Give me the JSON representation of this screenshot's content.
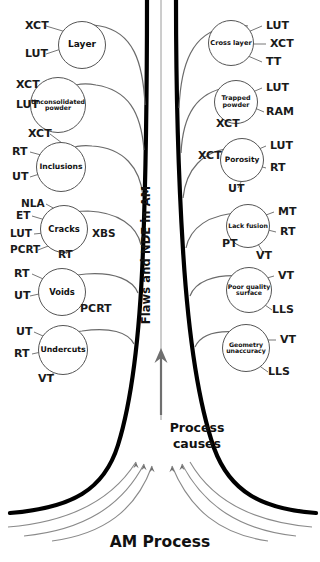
{
  "diagram": {
    "title_vertical": "Flaws and NDE in AM",
    "trunk_mid_label": "Process\ncauses",
    "trunk_mid_line1": "Process",
    "trunk_mid_line2": "causes",
    "base_label": "AM Process",
    "colors": {
      "trunk": "#000000",
      "branch": "#6b6b6b",
      "node_stroke": "#555555",
      "text": "#1a1a1a",
      "background": "#ffffff"
    }
  },
  "left_branches": [
    {
      "id": "layer",
      "label": "Layer",
      "label_lines": [
        "Layer"
      ],
      "nde": [
        "XCT",
        "LUT"
      ]
    },
    {
      "id": "unconsolidated-powder",
      "label": "Unconsolidated powder",
      "label_lines": [
        "Unconsolidated",
        "powder"
      ],
      "nde": [
        "XCT",
        "LUT"
      ]
    },
    {
      "id": "inclusions",
      "label": "Inclusions",
      "label_lines": [
        "Inclusions"
      ],
      "nde": [
        "XCT",
        "RT",
        "UT"
      ]
    },
    {
      "id": "cracks",
      "label": "Cracks",
      "label_lines": [
        "Cracks"
      ],
      "nde": [
        "NLA",
        "ET",
        "LUT",
        "PCRT",
        "RT",
        "XBS"
      ]
    },
    {
      "id": "voids",
      "label": "Voids",
      "label_lines": [
        "Voids"
      ],
      "nde": [
        "RT",
        "UT",
        "PCRT"
      ]
    },
    {
      "id": "undercuts",
      "label": "Undercuts",
      "label_lines": [
        "Undercuts"
      ],
      "nde": [
        "UT",
        "RT",
        "VT"
      ]
    }
  ],
  "right_branches": [
    {
      "id": "cross-layer",
      "label": "Cross layer",
      "label_lines": [
        "Cross layer"
      ],
      "nde": [
        "LUT",
        "XCT",
        "TT"
      ]
    },
    {
      "id": "trapped-powder",
      "label": "Trapped powder",
      "label_lines": [
        "Trapped",
        "powder"
      ],
      "nde": [
        "LUT",
        "RAM",
        "XCT"
      ]
    },
    {
      "id": "porosity",
      "label": "Porosity",
      "label_lines": [
        "Porosity"
      ],
      "nde": [
        "LUT",
        "RT",
        "XCT",
        "UT"
      ]
    },
    {
      "id": "lack-fusion",
      "label": "Lack fusion",
      "label_lines": [
        "Lack fusion"
      ],
      "nde": [
        "MT",
        "RT",
        "PT",
        "VT"
      ]
    },
    {
      "id": "poor-quality-surface",
      "label": "Poor quality surface",
      "label_lines": [
        "Poor quality",
        "surface"
      ],
      "nde": [
        "VT",
        "LLS"
      ]
    },
    {
      "id": "geometry-unaccuracy",
      "label": "Geometry unaccuracy",
      "label_lines": [
        "Geometry",
        "unaccuracy"
      ],
      "nde": [
        "VT",
        "LLS"
      ]
    }
  ],
  "nde_labels": {
    "l_layer_0": "XCT",
    "l_layer_1": "LUT",
    "l_unc_0": "XCT",
    "l_unc_1": "LUT",
    "l_inc_0": "XCT",
    "l_inc_1": "RT",
    "l_inc_2": "UT",
    "l_crk_0": "NLA",
    "l_crk_1": "ET",
    "l_crk_2": "LUT",
    "l_crk_3": "PCRT",
    "l_crk_4": "RT",
    "l_crk_5": "XBS",
    "l_vds_0": "RT",
    "l_vds_1": "UT",
    "l_vds_2": "PCRT",
    "l_und_0": "UT",
    "l_und_1": "RT",
    "l_und_2": "VT",
    "r_crl_0": "LUT",
    "r_crl_1": "XCT",
    "r_crl_2": "TT",
    "r_trp_0": "LUT",
    "r_trp_1": "RAM",
    "r_trp_2": "XCT",
    "r_por_0": "LUT",
    "r_por_1": "RT",
    "r_por_2": "XCT",
    "r_por_3": "UT",
    "r_lck_0": "MT",
    "r_lck_1": "RT",
    "r_lck_2": "PT",
    "r_lck_3": "VT",
    "r_pqs_0": "VT",
    "r_pqs_1": "LLS",
    "r_geo_0": "VT",
    "r_geo_1": "LLS"
  }
}
